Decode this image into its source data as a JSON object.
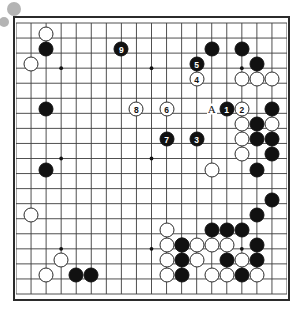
{
  "board": {
    "size": 19,
    "origin_x": 16,
    "origin_y": 19,
    "spacing": 15.05,
    "line_color": "#3c3c3c",
    "border_color": "#2b2b2b",
    "background": "#ffffff",
    "black_color": "#111111",
    "white_color": "#ffffff",
    "star_points": [
      [
        4,
        4
      ],
      [
        10,
        4
      ],
      [
        16,
        4
      ],
      [
        4,
        10
      ],
      [
        10,
        10
      ],
      [
        16,
        10
      ],
      [
        4,
        16
      ],
      [
        10,
        16
      ],
      [
        16,
        16
      ]
    ]
  },
  "captured_indicators": [
    {
      "name": "captured-stone-1",
      "x": 14,
      "y": 9,
      "r": 7,
      "color": "#b4b4b4"
    },
    {
      "name": "captured-stone-2",
      "x": 4,
      "y": 22,
      "r": 5,
      "color": "#b4b4b4"
    }
  ],
  "letter_marks": [
    {
      "label": "A",
      "col": 14,
      "row": 7
    }
  ],
  "numbered_moves": [
    {
      "number": "1",
      "color": "black",
      "col": 15,
      "row": 7
    },
    {
      "number": "2",
      "color": "white",
      "col": 16,
      "row": 7
    },
    {
      "number": "3",
      "color": "black",
      "col": 13,
      "row": 9
    },
    {
      "number": "4",
      "color": "white",
      "col": 13,
      "row": 5
    },
    {
      "number": "5",
      "color": "black",
      "col": 13,
      "row": 4
    },
    {
      "number": "6",
      "color": "white",
      "col": 11,
      "row": 7
    },
    {
      "number": "7",
      "color": "black",
      "col": 11,
      "row": 9
    },
    {
      "number": "8",
      "color": "white",
      "col": 9,
      "row": 7
    },
    {
      "number": "9",
      "color": "black",
      "col": 8,
      "row": 3
    }
  ],
  "black_stones": [
    [
      14,
      3
    ],
    [
      16,
      3
    ],
    [
      17,
      4
    ],
    [
      18,
      7
    ],
    [
      17,
      8
    ],
    [
      17,
      9
    ],
    [
      18,
      9
    ],
    [
      18,
      10
    ],
    [
      17,
      11
    ],
    [
      3,
      3
    ],
    [
      3,
      7
    ],
    [
      3,
      11
    ],
    [
      18,
      13
    ],
    [
      14,
      15
    ],
    [
      15,
      15
    ],
    [
      16,
      15
    ],
    [
      12,
      16
    ],
    [
      17,
      16
    ],
    [
      12,
      17
    ],
    [
      15,
      17
    ],
    [
      17,
      17
    ],
    [
      12,
      18
    ],
    [
      16,
      18
    ],
    [
      5,
      18
    ],
    [
      6,
      18
    ],
    [
      17,
      14
    ]
  ],
  "white_stones": [
    [
      3,
      2
    ],
    [
      2,
      4
    ],
    [
      16,
      5
    ],
    [
      17,
      5
    ],
    [
      18,
      5
    ],
    [
      16,
      8
    ],
    [
      18,
      8
    ],
    [
      16,
      9
    ],
    [
      16,
      10
    ],
    [
      14,
      11
    ],
    [
      2,
      14
    ],
    [
      11,
      16
    ],
    [
      12,
      16
    ],
    [
      11,
      17
    ],
    [
      11,
      18
    ],
    [
      13,
      16
    ],
    [
      14,
      16
    ],
    [
      15,
      16
    ],
    [
      16,
      17
    ],
    [
      14,
      18
    ],
    [
      15,
      18
    ],
    [
      17,
      18
    ],
    [
      4,
      17
    ],
    [
      13,
      17
    ],
    [
      3,
      18
    ],
    [
      11,
      15
    ]
  ]
}
